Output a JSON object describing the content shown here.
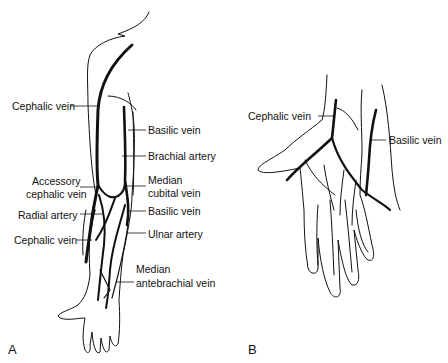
{
  "figure": {
    "panels": [
      {
        "letter": "A",
        "subject": "arm",
        "labels": {
          "cephalic_vein_upper": "Cephalic vein",
          "basilic_vein_upper": "Basilic vein",
          "brachial_artery": "Brachial artery",
          "accessory_cephalic_vein_1": "Accessory",
          "accessory_cephalic_vein_2": "cephalic vein",
          "median_cubital_vein_1": "Median",
          "median_cubital_vein_2": "cubital vein",
          "radial_artery": "Radial artery",
          "basilic_vein_lower": "Basilic vein",
          "cephalic_vein_lower": "Cephalic vein",
          "ulnar_artery": "Ulnar artery",
          "median_antebrachial_vein_1": "Median",
          "median_antebrachial_vein_2": "antebrachial vein"
        }
      },
      {
        "letter": "B",
        "subject": "hand",
        "labels": {
          "cephalic_vein": "Cephalic vein",
          "basilic_vein": "Basilic vein"
        }
      }
    ],
    "colors": {
      "line": "#111111",
      "background": "#ffffff"
    }
  }
}
